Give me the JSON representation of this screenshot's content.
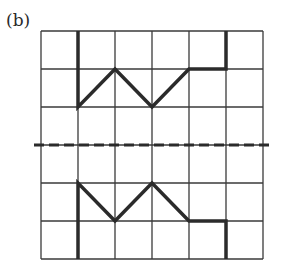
{
  "figure": {
    "label": "(b)",
    "grid": {
      "columns": 6,
      "rows": 6,
      "x0": 41,
      "y0": 31,
      "cell_w": 37,
      "cell_h": 38
    },
    "mirror_line": {
      "style": "dashed",
      "y": 145
    },
    "upper_shape": [
      [
        78,
        31
      ],
      [
        78,
        107
      ],
      [
        115,
        69
      ],
      [
        152,
        107
      ],
      [
        189,
        69
      ],
      [
        226,
        69
      ],
      [
        226,
        31
      ]
    ],
    "lower_shape": [
      [
        78,
        259
      ],
      [
        78,
        183
      ],
      [
        115,
        221
      ],
      [
        152,
        183
      ],
      [
        189,
        221
      ],
      [
        226,
        221
      ],
      [
        226,
        259
      ]
    ],
    "colors": {
      "line": "#2b2b2b",
      "grid": "#3a3a3a",
      "background": "#ffffff"
    }
  }
}
